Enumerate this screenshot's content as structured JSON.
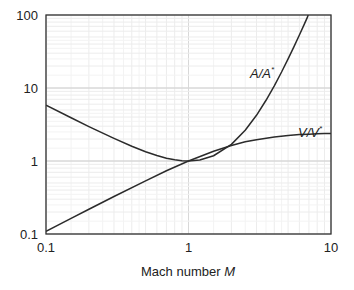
{
  "chart_data": {
    "type": "line",
    "title": "",
    "xlabel": "Mach number",
    "xlabel_var": "M",
    "ylabel": "",
    "xscale": "log",
    "yscale": "log",
    "xlim": [
      0.1,
      10
    ],
    "ylim": [
      0.1,
      100
    ],
    "grid": true,
    "x_ticks": [
      "0.1",
      "1",
      "10"
    ],
    "y_ticks": [
      "0.1",
      "1",
      "10",
      "100"
    ],
    "legend": "none (inline curve labels)",
    "series": [
      {
        "name": "A/A*",
        "label_text": "A/A",
        "label_sup": "*",
        "x": [
          0.1,
          0.15,
          0.2,
          0.3,
          0.4,
          0.5,
          0.6,
          0.7,
          0.8,
          0.9,
          1.0,
          1.2,
          1.5,
          2.0,
          2.5,
          3.0,
          3.5,
          4.0,
          4.5,
          5.0,
          5.5,
          6.0,
          6.5,
          6.8
        ],
        "values": [
          5.82,
          3.91,
          2.96,
          2.04,
          1.59,
          1.34,
          1.19,
          1.09,
          1.04,
          1.01,
          1.0,
          1.03,
          1.18,
          1.69,
          2.64,
          4.23,
          6.79,
          10.72,
          16.56,
          25.0,
          36.87,
          53.18,
          75.13,
          91.2
        ]
      },
      {
        "name": "V/V*",
        "label_text": "V/V",
        "label_sup": "*",
        "x": [
          0.1,
          0.15,
          0.2,
          0.3,
          0.5,
          0.7,
          1.0,
          1.5,
          2.0,
          2.5,
          3.0,
          4.0,
          5.0,
          6.0,
          7.0,
          8.0,
          9.0,
          10.0
        ],
        "values": [
          0.109,
          0.164,
          0.218,
          0.326,
          0.535,
          0.734,
          1.0,
          1.36,
          1.63,
          1.83,
          1.96,
          2.13,
          2.24,
          2.3,
          2.33,
          2.36,
          2.38,
          2.39
        ]
      }
    ]
  },
  "colors": {
    "curve": "#2b2b2b",
    "frame": "#333333",
    "grid": "#d8d8d8",
    "minor_grid": "#ececec"
  }
}
